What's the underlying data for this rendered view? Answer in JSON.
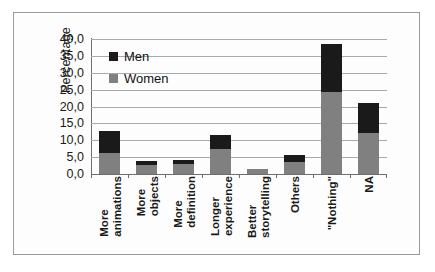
{
  "chart_data": {
    "type": "bar",
    "subtype": "stacked-vertical",
    "title": "",
    "xlabel": "",
    "ylabel": "Percentage",
    "ylim": [
      0,
      40
    ],
    "ytick_labels": [
      "40,0",
      "35,0",
      "30,0",
      "25,0",
      "20,0",
      "15,0",
      "10,0",
      "5,0",
      "0,0"
    ],
    "ytick_values": [
      40,
      35,
      30,
      25,
      20,
      15,
      10,
      5,
      0
    ],
    "grid": true,
    "legend_position": "inside-top-left",
    "decimal_separator": ",",
    "categories": [
      "More animations",
      "More objects",
      "More definition",
      "Longer experience",
      "Better storytelling",
      "Others",
      "\"Nothing\"",
      "NA"
    ],
    "category_lines": [
      [
        "More",
        "animations"
      ],
      [
        "More",
        "objects"
      ],
      [
        "More",
        "definition"
      ],
      [
        "Longer",
        "experience"
      ],
      [
        "Better",
        "storytelling"
      ],
      [
        "Others",
        ""
      ],
      [
        "\"Nothing\"",
        ""
      ],
      [
        "NA",
        ""
      ]
    ],
    "series": [
      {
        "name": "Women",
        "color": "#808080",
        "values": [
          6.3,
          2.8,
          3.0,
          7.5,
          1.6,
          3.5,
          24.3,
          12.3
        ]
      },
      {
        "name": "Men",
        "color": "#1a1a1a",
        "values": [
          6.4,
          1.2,
          1.2,
          4.1,
          0.0,
          2.2,
          14.3,
          8.7
        ]
      }
    ],
    "totals": [
      12.7,
      4.0,
      4.2,
      11.6,
      1.6,
      5.7,
      38.6,
      21.0
    ]
  },
  "legend": {
    "items": [
      {
        "label": "Men",
        "color": "#1a1a1a"
      },
      {
        "label": "Women",
        "color": "#808080"
      }
    ]
  },
  "axis": {
    "y_title": "Percentage"
  }
}
